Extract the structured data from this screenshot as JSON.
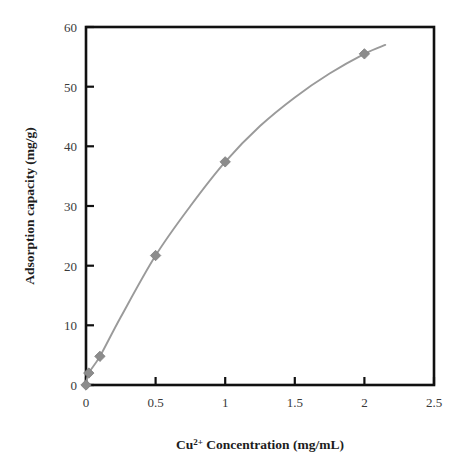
{
  "chart_data": {
    "type": "scatter",
    "title": "",
    "xlabel": "Cu2+ Concentration (mg/mL)",
    "xlabel_base": "Cu",
    "xlabel_sup": "2+",
    "xlabel_rest": " Concentration (mg/mL)",
    "ylabel": "Adsorption capacity (mg/g)",
    "xlim": [
      0,
      2.5
    ],
    "ylim": [
      0,
      60
    ],
    "xticks": [
      0,
      0.5,
      1,
      1.5,
      2,
      2.5
    ],
    "xtick_labels": [
      "0",
      "0.5",
      "1",
      "1.5",
      "2",
      "2.5"
    ],
    "yticks": [
      0,
      10,
      20,
      30,
      40,
      50,
      60
    ],
    "ytick_labels": [
      "0",
      "10",
      "20",
      "30",
      "40",
      "50",
      "60"
    ],
    "grid": false,
    "legend": null,
    "marker_color": "#8c8c8c",
    "line_color": "#9a9a9a",
    "axis_color": "#101010",
    "series": [
      {
        "name": "Adsorption isotherm",
        "marker": "diamond",
        "x": [
          0,
          0.02,
          0.1,
          0.5,
          1,
          2
        ],
        "y": [
          0,
          2.0,
          4.8,
          21.7,
          37.4,
          55.5
        ]
      }
    ],
    "fitted_curve": {
      "name": "fitted saturation curve",
      "x": [
        0,
        0.02,
        0.1,
        0.25,
        0.5,
        0.75,
        1,
        1.25,
        1.5,
        1.75,
        2,
        2.15
      ],
      "y": [
        0,
        2.0,
        4.8,
        11.4,
        21.7,
        30.0,
        37.4,
        43.4,
        48.2,
        52.2,
        55.5,
        57.0
      ]
    }
  },
  "axis_labels": {
    "x_title_base": "Cu",
    "x_title_sup": "2+",
    "x_title_rest": " Concentration (mg/mL)",
    "y_title": "Adsorption capacity (mg/g)"
  }
}
